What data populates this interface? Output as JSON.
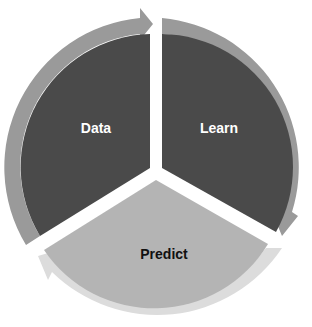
{
  "diagram": {
    "type": "cycle",
    "segments": [
      {
        "label": "Data",
        "fill": "#4a4a4a",
        "ring": "#9a9a9a",
        "text_color": "#ffffff"
      },
      {
        "label": "Learn",
        "fill": "#4a4a4a",
        "ring": "#9a9a9a",
        "text_color": "#ffffff"
      },
      {
        "label": "Predict",
        "fill": "#b4b4b4",
        "ring": "#dcdcdc",
        "text_color": "#111111"
      }
    ],
    "flow": [
      "Data",
      "Learn",
      "Predict",
      "Data"
    ]
  }
}
